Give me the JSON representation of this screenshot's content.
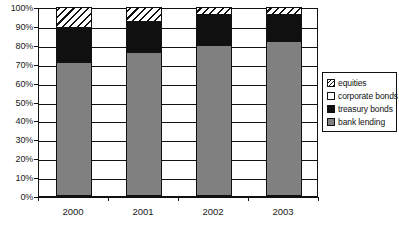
{
  "chart_data": {
    "type": "bar",
    "subtype": "stacked-100-percent",
    "title": "",
    "xlabel": "",
    "ylabel": "",
    "categories": [
      "2000",
      "2001",
      "2002",
      "2003"
    ],
    "series": [
      {
        "name": "bank lending",
        "values": [
          71,
          76,
          80,
          82
        ],
        "color": "#808080",
        "fill": "solid-gray"
      },
      {
        "name": "treasury bonds",
        "values": [
          18,
          16,
          16,
          14
        ],
        "color": "#101010",
        "fill": "solid-black"
      },
      {
        "name": "corporate bonds",
        "values": [
          0,
          0,
          0,
          0
        ],
        "color": "#ffffff",
        "fill": "white"
      },
      {
        "name": "equities",
        "values": [
          11,
          8,
          4,
          4
        ],
        "color": "#ffffff",
        "fill": "diagonal-hatch"
      }
    ],
    "stack_order_bottom_to_top": [
      "bank lending",
      "treasury bonds",
      "corporate bonds",
      "equities"
    ],
    "ylim": [
      0,
      100
    ],
    "yticks": [
      0,
      10,
      20,
      30,
      40,
      50,
      60,
      70,
      80,
      90,
      100
    ],
    "ytick_labels": [
      "0%",
      "10%",
      "20%",
      "30%",
      "40%",
      "50%",
      "60%",
      "70%",
      "80%",
      "90%",
      "100%"
    ],
    "grid": true,
    "legend_position": "right",
    "legend_entries": [
      "equities",
      "corporate bonds",
      "treasury bonds",
      "bank lending"
    ]
  },
  "legend": {
    "items": [
      {
        "label": "equities"
      },
      {
        "label": "corporate bonds"
      },
      {
        "label": "treasury bonds"
      },
      {
        "label": "bank lending"
      }
    ]
  }
}
